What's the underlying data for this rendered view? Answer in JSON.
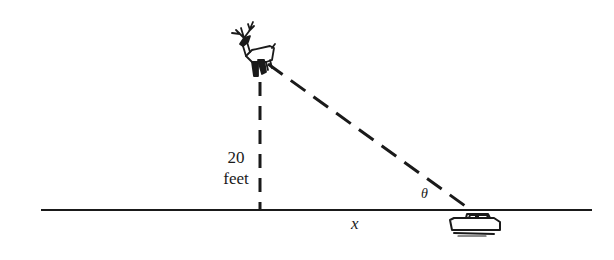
{
  "diagram": {
    "title": "",
    "labels": {
      "height_value": "20",
      "height_unit": "feet",
      "horizontal_distance": "x",
      "angle": "θ"
    },
    "elements": {
      "top_object": "deer-icon",
      "bottom_object": "car-icon",
      "ground": "horizontal-ground-line",
      "vertical_segment": "dashed-vertical-line",
      "line_of_sight": "dashed-hypotenuse"
    },
    "colors": {
      "stroke": "#1a1a1a",
      "background": "#ffffff"
    }
  }
}
